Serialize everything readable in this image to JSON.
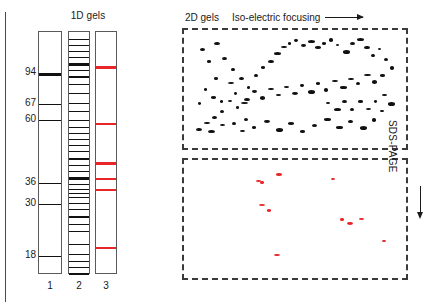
{
  "figure": {
    "panel_1d_title": "1D gels",
    "panel_2d_title": "2D gels",
    "axis_horizontal_label": "Iso-electric focusing",
    "axis_vertical_label": "SDS-PAGE",
    "colors": {
      "band_black": "#111111",
      "band_red": "#e8262a",
      "lane_border": "#5a5a5a",
      "panel_border": "#3a3a3a",
      "background": "#ffffff"
    }
  },
  "gels_1d": {
    "mw_markers": [
      {
        "label": "94",
        "y": 41
      },
      {
        "label": "67",
        "y": 72
      },
      {
        "label": "60",
        "y": 88
      },
      {
        "label": "36",
        "y": 151
      },
      {
        "label": "30",
        "y": 172
      },
      {
        "label": "18",
        "y": 224
      }
    ],
    "lanes": [
      {
        "number": "1",
        "name": "marker-ladder",
        "bands": [
          {
            "y": 41,
            "h": 3,
            "color": "black"
          },
          {
            "y": 72,
            "h": 1,
            "color": "black"
          },
          {
            "y": 88,
            "h": 1,
            "color": "black"
          },
          {
            "y": 151,
            "h": 1,
            "color": "black"
          },
          {
            "y": 172,
            "h": 1,
            "color": "black"
          },
          {
            "y": 224,
            "h": 1,
            "color": "black"
          }
        ]
      },
      {
        "number": "2",
        "name": "total-protein-lane",
        "bands": [
          {
            "y": 7,
            "h": 1,
            "color": "black"
          },
          {
            "y": 13,
            "h": 1,
            "color": "black"
          },
          {
            "y": 19,
            "h": 1,
            "color": "black"
          },
          {
            "y": 25,
            "h": 1,
            "color": "black"
          },
          {
            "y": 31,
            "h": 3,
            "color": "black"
          },
          {
            "y": 38,
            "h": 1,
            "color": "black"
          },
          {
            "y": 44,
            "h": 2,
            "color": "black"
          },
          {
            "y": 52,
            "h": 1,
            "color": "black"
          },
          {
            "y": 61,
            "h": 1,
            "color": "black"
          },
          {
            "y": 71,
            "h": 1,
            "color": "black"
          },
          {
            "y": 79,
            "h": 1,
            "color": "black"
          },
          {
            "y": 88,
            "h": 1,
            "color": "black"
          },
          {
            "y": 95,
            "h": 1,
            "color": "black"
          },
          {
            "y": 101,
            "h": 1,
            "color": "black"
          },
          {
            "y": 107,
            "h": 1,
            "color": "black"
          },
          {
            "y": 113,
            "h": 1,
            "color": "black"
          },
          {
            "y": 119,
            "h": 1,
            "color": "black"
          },
          {
            "y": 126,
            "h": 2,
            "color": "black"
          },
          {
            "y": 133,
            "h": 1,
            "color": "black"
          },
          {
            "y": 139,
            "h": 1,
            "color": "black"
          },
          {
            "y": 145,
            "h": 3,
            "color": "black"
          },
          {
            "y": 152,
            "h": 1,
            "color": "black"
          },
          {
            "y": 157,
            "h": 1,
            "color": "black"
          },
          {
            "y": 161,
            "h": 1,
            "color": "black"
          },
          {
            "y": 165,
            "h": 1,
            "color": "black"
          },
          {
            "y": 171,
            "h": 1,
            "color": "black"
          },
          {
            "y": 177,
            "h": 1,
            "color": "black"
          },
          {
            "y": 184,
            "h": 2,
            "color": "black"
          },
          {
            "y": 192,
            "h": 1,
            "color": "black"
          },
          {
            "y": 199,
            "h": 1,
            "color": "black"
          },
          {
            "y": 212,
            "h": 1,
            "color": "black"
          },
          {
            "y": 222,
            "h": 1,
            "color": "black"
          },
          {
            "y": 229,
            "h": 1,
            "color": "black"
          },
          {
            "y": 235,
            "h": 1,
            "color": "black"
          },
          {
            "y": 241,
            "h": 2,
            "color": "black"
          }
        ]
      },
      {
        "number": "3",
        "name": "selected-proteins-lane",
        "bands": [
          {
            "y": 34,
            "h": 3,
            "color": "red"
          },
          {
            "y": 91,
            "h": 2,
            "color": "red"
          },
          {
            "y": 130,
            "h": 3,
            "color": "red"
          },
          {
            "y": 146,
            "h": 2,
            "color": "red"
          },
          {
            "y": 157,
            "h": 2,
            "color": "red"
          },
          {
            "y": 215,
            "h": 2,
            "color": "red"
          }
        ]
      }
    ]
  },
  "chart_data": {
    "type": "scatter",
    "title": "2D gels",
    "xlabel": "Iso-electric focusing",
    "ylabel": "SDS-PAGE",
    "panels": [
      {
        "name": "top-panel-total-proteome",
        "spot_color": "#111111",
        "spot_count": 86,
        "spots": [
          [
            16,
            18
          ],
          [
            23,
            30
          ],
          [
            30,
            12
          ],
          [
            38,
            27
          ],
          [
            47,
            38
          ],
          [
            30,
            47
          ],
          [
            44,
            52
          ],
          [
            55,
            47
          ],
          [
            20,
            58
          ],
          [
            27,
            66
          ],
          [
            14,
            72
          ],
          [
            36,
            70
          ],
          [
            50,
            62
          ],
          [
            57,
            72
          ],
          [
            63,
            56
          ],
          [
            70,
            44
          ],
          [
            77,
            36
          ],
          [
            84,
            30
          ],
          [
            90,
            22
          ],
          [
            97,
            16
          ],
          [
            104,
            12
          ],
          [
            110,
            9
          ],
          [
            117,
            14
          ],
          [
            124,
            10
          ],
          [
            131,
            16
          ],
          [
            138,
            12
          ],
          [
            145,
            8
          ],
          [
            152,
            14
          ],
          [
            159,
            20
          ],
          [
            166,
            12
          ],
          [
            173,
            8
          ],
          [
            180,
            16
          ],
          [
            187,
            24
          ],
          [
            194,
            18
          ],
          [
            200,
            28
          ],
          [
            206,
            36
          ],
          [
            196,
            44
          ],
          [
            188,
            50
          ],
          [
            180,
            44
          ],
          [
            172,
            52
          ],
          [
            164,
            48
          ],
          [
            156,
            56
          ],
          [
            148,
            50
          ],
          [
            140,
            58
          ],
          [
            132,
            52
          ],
          [
            124,
            60
          ],
          [
            116,
            54
          ],
          [
            108,
            62
          ],
          [
            100,
            56
          ],
          [
            92,
            64
          ],
          [
            84,
            58
          ],
          [
            76,
            66
          ],
          [
            68,
            60
          ],
          [
            60,
            68
          ],
          [
            52,
            76
          ],
          [
            44,
            70
          ],
          [
            36,
            80
          ],
          [
            28,
            86
          ],
          [
            20,
            92
          ],
          [
            12,
            98
          ],
          [
            24,
            100
          ],
          [
            36,
            94
          ],
          [
            48,
            92
          ],
          [
            60,
            88
          ],
          [
            56,
            100
          ],
          [
            68,
            96
          ],
          [
            80,
            90
          ],
          [
            92,
            98
          ],
          [
            104,
            92
          ],
          [
            116,
            100
          ],
          [
            128,
            94
          ],
          [
            140,
            88
          ],
          [
            152,
            96
          ],
          [
            164,
            90
          ],
          [
            176,
            96
          ],
          [
            188,
            88
          ],
          [
            196,
            80
          ],
          [
            204,
            72
          ],
          [
            198,
            64
          ],
          [
            190,
            70
          ],
          [
            182,
            78
          ],
          [
            174,
            70
          ],
          [
            166,
            78
          ],
          [
            158,
            70
          ],
          [
            150,
            78
          ],
          [
            142,
            72
          ]
        ]
      },
      {
        "name": "bottom-panel-selected-proteins",
        "spot_color": "#e8262a",
        "spot_count": 11,
        "spots": [
          [
            76,
            21
          ],
          [
            92,
            13
          ],
          [
            147,
            18
          ],
          [
            75,
            44
          ],
          [
            83,
            49
          ],
          [
            156,
            58
          ],
          [
            163,
            62
          ],
          [
            175,
            58
          ],
          [
            198,
            80
          ],
          [
            90,
            94
          ],
          [
            72,
            20
          ]
        ]
      }
    ],
    "axis_directions": {
      "x": "left-to-right",
      "y": "top-to-bottom"
    }
  }
}
